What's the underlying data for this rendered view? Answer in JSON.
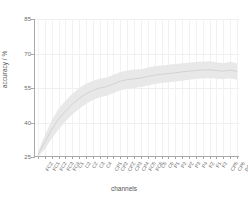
{
  "chart_data": {
    "type": "line",
    "title": "",
    "xlabel": "channels",
    "ylabel": "accuracy / %",
    "ylim": [
      25,
      85
    ],
    "yticks": [
      25,
      40,
      55,
      70,
      85
    ],
    "ytick_labels": [
      "25",
      "40",
      "55",
      "70",
      "85"
    ],
    "grid": true,
    "legend": "none",
    "band_label": "standard deviation",
    "colors": {
      "line": "#cfcfcf",
      "band": "#e8e8e8",
      "axis": "#a8a8a8",
      "grid": "#f2f2f2",
      "text": "#6b6b6b",
      "background": "#ffffff"
    },
    "categories": [
      "FCZ",
      "FC1",
      "FC2",
      "FC3",
      "FC4",
      "C1",
      "C2",
      "CZ",
      "C3",
      "C4",
      "CP1",
      "CP2",
      "CPZ",
      "CP3",
      "CP4",
      "FC5",
      "FC6",
      "C5",
      "C6",
      "P1",
      "P2",
      "PZ",
      "P3",
      "P4",
      "FZ",
      "F1",
      "F2",
      "CP5",
      "CP6",
      "PO3"
    ],
    "series": [
      {
        "name": "mean accuracy",
        "values": [
          26.0,
          31.5,
          37.0,
          41.5,
          45.0,
          48.0,
          50.5,
          52.5,
          54.0,
          55.0,
          55.6,
          56.8,
          58.0,
          58.6,
          59.0,
          59.3,
          60.0,
          60.6,
          61.0,
          61.3,
          61.6,
          62.0,
          62.3,
          62.6,
          62.8,
          62.9,
          62.6,
          62.3,
          62.8,
          62.2
        ]
      },
      {
        "name": "upper bound",
        "values": [
          27.2,
          34.5,
          41.0,
          46.0,
          49.5,
          52.5,
          55.0,
          56.8,
          58.2,
          59.0,
          59.6,
          60.8,
          62.0,
          62.6,
          63.0,
          63.2,
          63.9,
          64.5,
          64.8,
          65.1,
          65.4,
          65.8,
          66.0,
          66.3,
          66.5,
          66.6,
          66.2,
          65.8,
          66.4,
          65.8
        ]
      },
      {
        "name": "lower bound",
        "values": [
          25.0,
          28.5,
          33.0,
          37.0,
          40.5,
          43.5,
          46.0,
          48.2,
          49.8,
          51.0,
          51.6,
          52.8,
          54.0,
          54.6,
          55.0,
          55.4,
          56.1,
          56.7,
          57.2,
          57.5,
          57.8,
          58.2,
          58.6,
          58.9,
          59.1,
          59.2,
          59.0,
          58.8,
          59.2,
          58.6
        ]
      }
    ]
  }
}
